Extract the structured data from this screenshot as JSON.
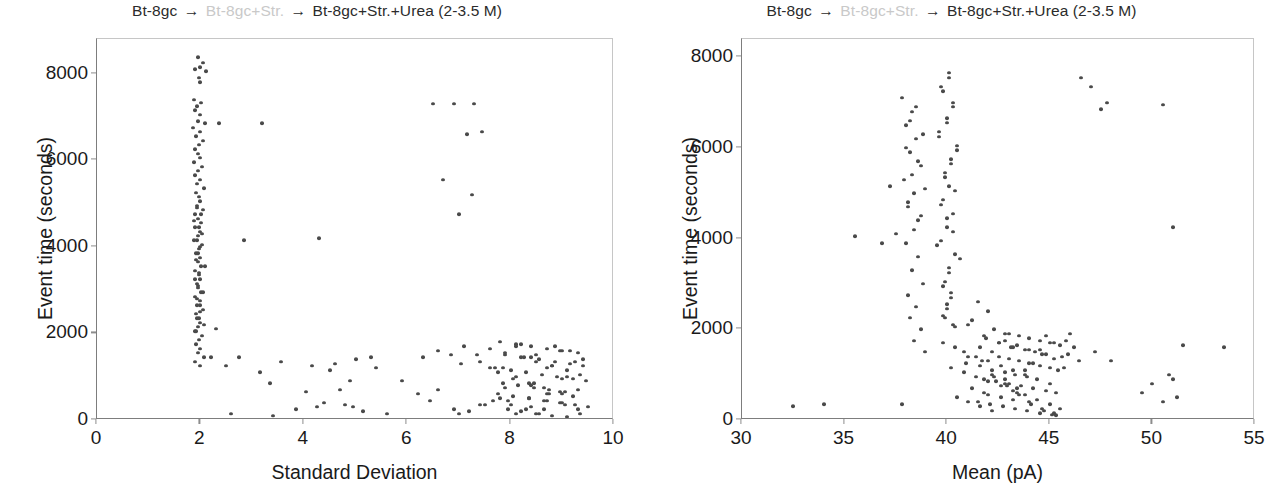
{
  "figure": {
    "background_color": "#ffffff",
    "point_color": "#4a4a4a",
    "axis_color": "#7d7d7d",
    "faded_text_color": "#c9c9c9"
  },
  "panels": [
    {
      "id": "left",
      "title": {
        "segment_1": "Bt-8gc",
        "arrow_1": "→",
        "segment_2": "Bt-8gc+Str.",
        "arrow_2": "→",
        "segment_3": "Bt-8gc+Str.+Urea (2-3.5 M)",
        "full_text": "Bt-8gc → Bt-8gc+Str. → Bt-8gc+Str.+Urea (2-3.5 M)"
      },
      "xlabel": "Standard Deviation",
      "ylabel": "Event time (seconds)",
      "xticks": [
        "0",
        "2",
        "4",
        "6",
        "8",
        "10"
      ],
      "yticks": [
        "0",
        "2000",
        "4000",
        "6000",
        "8000"
      ]
    },
    {
      "id": "right",
      "title": {
        "segment_1": "Bt-8gc",
        "arrow_1": "→",
        "segment_2": "Bt-8gc+Str.",
        "arrow_2": "→",
        "segment_3": "Bt-8gc+Str.+Urea (2-3.5 M)",
        "full_text": "Bt-8gc → Bt-8gc+Str. → Bt-8gc+Str.+Urea (2-3.5 M)"
      },
      "xlabel": "Mean (pA)",
      "ylabel": "Event time (seconds)",
      "xticks": [
        "30",
        "35",
        "40",
        "45",
        "50",
        "55"
      ],
      "yticks": [
        "0",
        "2000",
        "4000",
        "6000",
        "8000"
      ]
    }
  ],
  "chart_data": [
    {
      "type": "scatter",
      "panel": "left",
      "title": "Bt-8gc → Bt-8gc+Str. → Bt-8gc+Str.+Urea (2-3.5 M)",
      "xlabel": "Standard Deviation",
      "ylabel": "Event time (seconds)",
      "xlim": [
        0,
        10
      ],
      "ylim": [
        0,
        8800
      ],
      "xticks": [
        0,
        2,
        4,
        6,
        8,
        10
      ],
      "yticks": [
        0,
        2000,
        4000,
        6000,
        8000
      ],
      "grid": false,
      "legend": "none",
      "marker_color": "#4a4a4a",
      "x": [
        1.95,
        2.05,
        2.0,
        1.9,
        2.1,
        1.97,
        2.0,
        1.88,
        2.02,
        1.93,
        1.9,
        2.0,
        1.95,
        2.08,
        1.85,
        2.0,
        1.92,
        2.05,
        1.98,
        1.9,
        1.95,
        2.0,
        1.87,
        2.03,
        1.96,
        1.9,
        2.0,
        1.94,
        2.06,
        1.91,
        1.98,
        2.0,
        1.93,
        2.05,
        1.89,
        1.96,
        2.02,
        1.9,
        1.99,
        1.95,
        1.88,
        2.04,
        1.97,
        1.92,
        2.0,
        1.95,
        2.08,
        1.9,
        1.98,
        2.0,
        1.93,
        1.96,
        2.02,
        1.9,
        1.99,
        1.94,
        2.05,
        1.91,
        1.97,
        2.0,
        1.95,
        1.89,
        2.03,
        1.98,
        1.92,
        2.0,
        1.96,
        2.06,
        1.9,
        1.99,
        1.94,
        2.01,
        1.88,
        1.97,
        2.04,
        1.93,
        2.0,
        1.95,
        1.91,
        2.02,
        1.98,
        1.9,
        1.96,
        2.05,
        1.93,
        1.99,
        2.0,
        1.94,
        2.07,
        1.92,
        2.35,
        3.2,
        2.85,
        2.5,
        2.2,
        2.6,
        3.4,
        2.3,
        4.3,
        4.6,
        4.8,
        5.0,
        4.15,
        5.3,
        4.9,
        4.5,
        6.5,
        6.9,
        7.3,
        7.45,
        7.15,
        6.7,
        7.25,
        7.0,
        6.3,
        6.85,
        7.4,
        7.6,
        7.1,
        6.6,
        7.35,
        7.05,
        7.8,
        8.1,
        8.4,
        8.7,
        9.0,
        9.3,
        7.9,
        8.25,
        8.55,
        8.85,
        9.15,
        9.4,
        7.7,
        8.0,
        8.3,
        8.6,
        8.9,
        9.2,
        9.45,
        7.85,
        8.15,
        8.45,
        8.75,
        9.05,
        7.75,
        8.05,
        8.35,
        8.65,
        8.95,
        9.25,
        9.5,
        7.95,
        8.2,
        8.5,
        8.8,
        9.1,
        7.6,
        7.9,
        8.2,
        8.5,
        8.8,
        9.1,
        9.35,
        8.05,
        8.35,
        8.65,
        8.95,
        9.2,
        7.65,
        8.0,
        8.3,
        8.55,
        8.85,
        9.15,
        9.4,
        7.85,
        8.1,
        8.4,
        8.7,
        9.0,
        6.9,
        7.2,
        7.5,
        7.8,
        8.1,
        8.4,
        8.7,
        9.0,
        9.3,
        6.6,
        7.0,
        7.4,
        5.4,
        5.9,
        6.2,
        4.95,
        5.6,
        6.45,
        4.7,
        5.15,
        3.55,
        4.05,
        4.4,
        3.15,
        3.85,
        2.75,
        3.35,
        4.25,
        8.2,
        8.5,
        8.8,
        9.1,
        7.9,
        8.35,
        8.65,
        8.95,
        9.25,
        7.75,
        8.45,
        8.75,
        9.05,
        9.35,
        8.1,
        8.4,
        8.7,
        9.0,
        9.3,
        7.95
      ],
      "y": [
        8380,
        8250,
        8150,
        8100,
        8050,
        7900,
        7800,
        7400,
        7320,
        7250,
        7150,
        7050,
        6900,
        6850,
        6750,
        6650,
        6550,
        6450,
        6350,
        6250,
        6150,
        6050,
        5950,
        5850,
        5750,
        5650,
        5550,
        5450,
        5350,
        5250,
        5150,
        5050,
        4950,
        4850,
        4750,
        4650,
        4550,
        4450,
        4350,
        4250,
        4150,
        4050,
        3950,
        3850,
        3750,
        3650,
        3550,
        3450,
        3350,
        3250,
        3150,
        3050,
        2950,
        2850,
        2750,
        2650,
        2550,
        2450,
        2350,
        2250,
        2150,
        2050,
        1950,
        1850,
        1750,
        1650,
        1550,
        1450,
        1350,
        1250,
        4900,
        4750,
        4600,
        4450,
        4300,
        4150,
        4000,
        3850,
        3700,
        3550,
        3400,
        3250,
        3100,
        2950,
        2800,
        2650,
        2500,
        2350,
        2200,
        2050,
        6850,
        6850,
        4150,
        1250,
        1450,
        150,
        100,
        2100,
        4200,
        1300,
        350,
        1400,
        1250,
        1450,
        900,
        1150,
        7300,
        7300,
        7300,
        6650,
        6600,
        5550,
        5200,
        4750,
        1450,
        1500,
        1350,
        1200,
        1700,
        1600,
        1500,
        1300,
        1800,
        1750,
        1700,
        1650,
        1600,
        1550,
        1500,
        1450,
        1400,
        1350,
        1300,
        1250,
        1200,
        1150,
        1100,
        1050,
        1000,
        950,
        900,
        850,
        800,
        750,
        700,
        650,
        600,
        550,
        500,
        450,
        400,
        350,
        300,
        250,
        200,
        150,
        100,
        80,
        1650,
        1550,
        1450,
        1350,
        1250,
        1150,
        1050,
        950,
        850,
        750,
        650,
        550,
        450,
        350,
        250,
        150,
        1700,
        1600,
        1400,
        1200,
        1000,
        800,
        600,
        400,
        250,
        200,
        350,
        500,
        150,
        300,
        450,
        600,
        250,
        700,
        150,
        350,
        1200,
        900,
        600,
        300,
        150,
        450,
        700,
        200,
        1350,
        650,
        400,
        1100,
        250,
        1450,
        850,
        300,
        1750,
        1500,
        1250,
        1000,
        750,
        500,
        250,
        1600,
        1350,
        1100,
        850,
        600,
        350,
        150,
        1700,
        1450,
        1200,
        950,
        700,
        450
      ],
      "notes": "Dense vertical band at SD~1.9-2.1 spanning 1000-8400 s; dense lower-right cluster at SD 7.5-9.5, t<2000 s; sparse mid-range outliers"
    },
    {
      "type": "scatter",
      "panel": "right",
      "title": "Bt-8gc → Bt-8gc+Str. → Bt-8gc+Str.+Urea (2-3.5 M)",
      "xlabel": "Mean (pA)",
      "ylabel": "Event time (seconds)",
      "xlim": [
        30,
        55
      ],
      "ylim": [
        0,
        8400
      ],
      "xticks": [
        30,
        35,
        40,
        45,
        50,
        55
      ],
      "yticks": [
        0,
        2000,
        4000,
        6000,
        8000
      ],
      "grid": false,
      "legend": "none",
      "marker_color": "#4a4a4a",
      "x": [
        40.1,
        39.8,
        40.3,
        40.0,
        39.6,
        40.5,
        40.2,
        39.9,
        40.4,
        39.7,
        40.0,
        40.3,
        39.5,
        40.6,
        40.1,
        39.8,
        40.2,
        40.0,
        39.9,
        40.4,
        40.1,
        39.7,
        40.3,
        40.0,
        39.6,
        40.5,
        40.2,
        39.9,
        40.1,
        39.8,
        40.3,
        40.0,
        39.7,
        40.4,
        40.1,
        39.9,
        40.2,
        40.0,
        39.8,
        40.3,
        38.5,
        38.2,
        38.8,
        38.0,
        38.6,
        38.3,
        38.9,
        38.1,
        38.7,
        38.4,
        38.0,
        38.6,
        38.3,
        38.8,
        38.1,
        38.5,
        38.2,
        38.7,
        38.4,
        38.9,
        37.8,
        38.3,
        38.0,
        38.5,
        38.2,
        38.7,
        37.9,
        38.4,
        38.1,
        38.6,
        41.5,
        42.0,
        41.2,
        42.3,
        41.8,
        42.5,
        41.0,
        42.8,
        41.6,
        42.2,
        43.0,
        43.5,
        44.0,
        44.5,
        45.0,
        45.5,
        43.2,
        43.8,
        44.3,
        44.8,
        42.5,
        43.0,
        43.5,
        44.0,
        44.5,
        45.0,
        45.4,
        42.8,
        43.3,
        43.9,
        41.8,
        42.4,
        43.0,
        43.6,
        44.2,
        44.8,
        45.3,
        42.0,
        42.6,
        43.2,
        41.5,
        42.1,
        42.7,
        43.3,
        43.9,
        44.5,
        45.1,
        41.9,
        42.5,
        43.1,
        40.8,
        41.4,
        42.0,
        42.6,
        43.2,
        43.8,
        44.4,
        45.0,
        41.2,
        41.8,
        40.5,
        41.0,
        41.6,
        42.2,
        42.8,
        43.4,
        44.0,
        44.6,
        45.2,
        40.9,
        40.2,
        40.8,
        41.4,
        42.0,
        42.6,
        43.2,
        43.8,
        44.4,
        45.0,
        45.5,
        39.8,
        40.4,
        41.0,
        41.6,
        42.2,
        42.8,
        43.4,
        44.0,
        44.6,
        45.2,
        42.3,
        42.9,
        43.5,
        44.1,
        44.7,
        45.3,
        41.7,
        42.2,
        42.8,
        43.4,
        37.2,
        37.5,
        36.8,
        37.8,
        35.5,
        32.5,
        34.0,
        46.5,
        47.0,
        47.5,
        50.5,
        51.0,
        51.5,
        53.5,
        47.8,
        50.8,
        51.2,
        46.0,
        45.8,
        46.2,
        45.9,
        46.4,
        45.7,
        44.8,
        45.2,
        44.5,
        45.6,
        44.2,
        43.8,
        50.0,
        51.0,
        49.5,
        50.5,
        47.2,
        48.0
      ],
      "y": [
        7550,
        7250,
        6900,
        6550,
        6250,
        5950,
        5650,
        5350,
        5050,
        4750,
        4450,
        4150,
        3850,
        3550,
        3250,
        2950,
        2700,
        2450,
        2250,
        2050,
        7650,
        7350,
        7000,
        6650,
        6350,
        6050,
        5750,
        5450,
        5150,
        4850,
        4550,
        4250,
        3950,
        3650,
        3350,
        3050,
        2800,
        2550,
        2300,
        2100,
        6900,
        6600,
        6300,
        6000,
        5700,
        5400,
        5100,
        4800,
        4500,
        4200,
        3900,
        3600,
        3300,
        3000,
        2750,
        2500,
        2250,
        2000,
        1750,
        1500,
        7100,
        6800,
        6500,
        6200,
        5900,
        5600,
        5300,
        5000,
        4700,
        4400,
        2600,
        2400,
        2200,
        2000,
        1850,
        1700,
        2100,
        1900,
        1600,
        1500,
        1900,
        1850,
        1800,
        1750,
        1700,
        1650,
        1600,
        1550,
        1500,
        1450,
        1400,
        1350,
        1300,
        1250,
        1200,
        1150,
        1100,
        1050,
        1000,
        950,
        900,
        850,
        800,
        750,
        700,
        650,
        600,
        550,
        500,
        450,
        400,
        350,
        300,
        250,
        200,
        150,
        120,
        1800,
        1700,
        1600,
        1500,
        1400,
        1300,
        1200,
        1100,
        1000,
        900,
        800,
        700,
        600,
        500,
        400,
        300,
        200,
        1750,
        1650,
        1550,
        1450,
        1350,
        1250,
        1150,
        1050,
        950,
        850,
        750,
        650,
        550,
        450,
        350,
        250,
        1700,
        1600,
        1400,
        1200,
        1000,
        800,
        600,
        400,
        250,
        150,
        950,
        750,
        550,
        350,
        200,
        100,
        1300,
        1100,
        900,
        700,
        5150,
        4100,
        3900,
        350,
        4050,
        300,
        350,
        7550,
        7350,
        6850,
        6950,
        4250,
        1650,
        1600,
        7000,
        1000,
        500,
        1900,
        1750,
        1600,
        1450,
        1300,
        1150,
        1850,
        1700,
        1550,
        1400,
        1250,
        1100,
        800,
        900,
        600,
        400,
        1500,
        1300
      ],
      "notes": "Two vertical bands at Mean~38.3 and ~40.1 spanning 1500-7600 s; dense lower cluster at Mean 40-46, t<2000 s; sparse outliers at Mean 32-37 and 47-54"
    }
  ]
}
